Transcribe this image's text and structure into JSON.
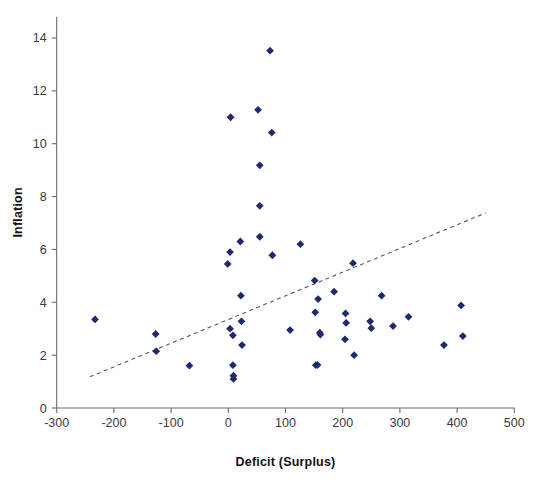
{
  "chart_data": {
    "type": "scatter",
    "title": "",
    "xlabel": "Deficit (Surplus)",
    "ylabel": "Inflation",
    "xlim": [
      -300,
      500
    ],
    "ylim": [
      0,
      14.8
    ],
    "xticks": [
      -300,
      -200,
      -100,
      0,
      100,
      200,
      300,
      400,
      500
    ],
    "xtick_labels": [
      "-300",
      "-200",
      "-100",
      "0",
      "100",
      "200",
      "300",
      "400",
      "500"
    ],
    "yticks": [
      0,
      2,
      4,
      6,
      8,
      10,
      12,
      14
    ],
    "ytick_labels": [
      "0",
      "2",
      "4",
      "6",
      "8",
      "10",
      "12",
      "14"
    ],
    "grid": false,
    "legend": null,
    "marker": "diamond",
    "marker_color": "#1f2a6e",
    "points": [
      {
        "x": -233,
        "y": 3.35
      },
      {
        "x": -127,
        "y": 2.8
      },
      {
        "x": -126,
        "y": 2.15
      },
      {
        "x": -68,
        "y": 1.6
      },
      {
        "x": -1,
        "y": 5.45
      },
      {
        "x": 3,
        "y": 5.9
      },
      {
        "x": 4,
        "y": 11.0
      },
      {
        "x": 3,
        "y": 3.0
      },
      {
        "x": 8,
        "y": 2.75
      },
      {
        "x": 8,
        "y": 1.62
      },
      {
        "x": 9,
        "y": 1.22
      },
      {
        "x": 9,
        "y": 1.1
      },
      {
        "x": 21,
        "y": 6.3
      },
      {
        "x": 22,
        "y": 4.25
      },
      {
        "x": 23,
        "y": 3.28
      },
      {
        "x": 24,
        "y": 2.38
      },
      {
        "x": 52,
        "y": 11.28
      },
      {
        "x": 55,
        "y": 9.18
      },
      {
        "x": 55,
        "y": 7.65
      },
      {
        "x": 55,
        "y": 6.48
      },
      {
        "x": 73,
        "y": 13.52
      },
      {
        "x": 76,
        "y": 10.42
      },
      {
        "x": 77,
        "y": 5.78
      },
      {
        "x": 108,
        "y": 2.95
      },
      {
        "x": 126,
        "y": 6.2
      },
      {
        "x": 151,
        "y": 4.82
      },
      {
        "x": 152,
        "y": 3.62
      },
      {
        "x": 153,
        "y": 1.62
      },
      {
        "x": 157,
        "y": 4.12
      },
      {
        "x": 160,
        "y": 2.85
      },
      {
        "x": 161,
        "y": 2.78
      },
      {
        "x": 156,
        "y": 1.63
      },
      {
        "x": 185,
        "y": 4.4
      },
      {
        "x": 205,
        "y": 3.58
      },
      {
        "x": 206,
        "y": 3.22
      },
      {
        "x": 204,
        "y": 2.6
      },
      {
        "x": 218,
        "y": 5.48
      },
      {
        "x": 220,
        "y": 2.0
      },
      {
        "x": 248,
        "y": 3.28
      },
      {
        "x": 250,
        "y": 3.02
      },
      {
        "x": 268,
        "y": 4.25
      },
      {
        "x": 288,
        "y": 3.1
      },
      {
        "x": 315,
        "y": 3.45
      },
      {
        "x": 377,
        "y": 2.38
      },
      {
        "x": 407,
        "y": 3.88
      },
      {
        "x": 410,
        "y": 2.72
      }
    ],
    "trend_line": {
      "style": "dashed",
      "color": "#5a5a5a",
      "x_start": -242,
      "y_start": 1.18,
      "x_end": 450,
      "y_end": 7.38
    }
  },
  "axes": {
    "y_axis_name": "inflation-axis",
    "x_axis_name": "deficit-axis"
  }
}
